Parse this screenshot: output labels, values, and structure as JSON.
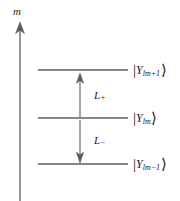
{
  "figure": {
    "background_color": "#ffffff",
    "stroke_color": "#555555",
    "text_color": "#1a1a1a",
    "width": 180,
    "height": 201
  },
  "axis": {
    "label": "m",
    "name": "magnetic-quantum-number-axis",
    "direction": "up",
    "x": 20,
    "top_y": 25,
    "bottom_y": 201
  },
  "levels": [
    {
      "id": "level-top",
      "y": 70,
      "x1": 38,
      "x2": 128
    },
    {
      "id": "level-middle",
      "y": 118,
      "x1": 38,
      "x2": 128
    },
    {
      "id": "level-bottom",
      "y": 164,
      "x1": 38,
      "x2": 128
    }
  ],
  "kets": [
    {
      "id": "ket-top",
      "bar": "|",
      "symbol": "Y",
      "subscript_main": "lm",
      "subscript_op": "+1",
      "angle": "⟩",
      "full_text": "|Ylm+1⟩",
      "x": 133,
      "y": 63
    },
    {
      "id": "ket-middle",
      "bar": "|",
      "symbol": "Y",
      "subscript_main": "lm",
      "subscript_op": "",
      "angle": "⟩",
      "full_text": "|Ylm⟩",
      "x": 133,
      "y": 111
    },
    {
      "id": "ket-bottom",
      "bar": "|",
      "symbol": "Y",
      "subscript_main": "lm",
      "subscript_op": "−1",
      "angle": "⟩",
      "full_text": "|Ylm−1⟩",
      "x": 133,
      "y": 157
    }
  ],
  "operators": [
    {
      "id": "raising-operator",
      "symbol": "L",
      "sign": "+",
      "full_text": "L+",
      "arrow_direction": "up",
      "arrow_x": 80,
      "arrow_from_y": 118,
      "arrow_to_y": 74,
      "label_x": 94,
      "label_y": 90
    },
    {
      "id": "lowering-operator",
      "symbol": "L",
      "sign": "−",
      "full_text": "L−",
      "arrow_direction": "down",
      "arrow_x": 80,
      "arrow_from_y": 120,
      "arrow_to_y": 162,
      "label_x": 94,
      "label_y": 135
    }
  ]
}
